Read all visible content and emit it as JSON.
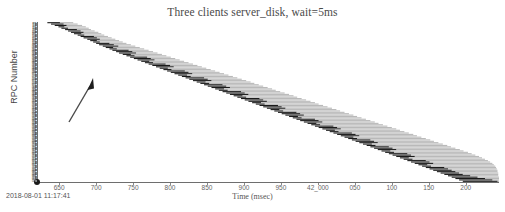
{
  "chart_data": {
    "type": "bar",
    "title": "Three clients server_disk, wait=5ms",
    "subtitle": "",
    "xlabel": "Time (msec)",
    "ylabel": "RPC Number",
    "grid": false,
    "legend_position": "none",
    "orientation": "horizontal-timeline",
    "xlim": [
      41620,
      42245
    ],
    "ylim": [
      0,
      116
    ],
    "xtick_labels": [
      "650",
      "700",
      "750",
      "800",
      "850",
      "900",
      "950",
      "42_000",
      "050",
      "100",
      "150",
      "200"
    ],
    "xtick_values": [
      41650,
      41700,
      41750,
      41800,
      41850,
      41900,
      41950,
      42000,
      42050,
      42100,
      42150,
      42200
    ],
    "ytick_labels_note": "dense unreadable microtext RPC id labels, ~116 rows",
    "ytick_count": 116,
    "series": [
      {
        "name": "rpc-dark-segment",
        "color": "#1a1a1a"
      },
      {
        "name": "rpc-light-segment",
        "color": "#b9b9b9"
      }
    ],
    "annotations": [
      {
        "name": "upward-arrow",
        "x1": 75,
        "y1": 122,
        "x2": 96,
        "y2": 80,
        "color": "#4a4a4a"
      }
    ],
    "bars": [
      {
        "row": 0,
        "dark_start": 41634,
        "dark_end": 41651,
        "light_start": 41651,
        "light_end": 41669
      },
      {
        "row": 1,
        "dark_start": 41639,
        "dark_end": 41656,
        "light_start": 41656,
        "light_end": 41675
      },
      {
        "row": 2,
        "dark_start": 41644,
        "dark_end": 41660,
        "light_start": 41660,
        "light_end": 41681
      },
      {
        "row": 3,
        "dark_start": 41649,
        "dark_end": 41657,
        "light_start": 41657,
        "light_end": 41686
      },
      {
        "row": 4,
        "dark_start": 41653,
        "dark_end": 41662,
        "light_start": 41662,
        "light_end": 41690
      },
      {
        "row": 5,
        "dark_start": 41658,
        "dark_end": 41674,
        "light_start": 41674,
        "light_end": 41693
      },
      {
        "row": 6,
        "dark_start": 41662,
        "dark_end": 41679,
        "light_start": 41679,
        "light_end": 41698
      },
      {
        "row": 7,
        "dark_start": 41666,
        "dark_end": 41683,
        "light_start": 41683,
        "light_end": 41703
      },
      {
        "row": 8,
        "dark_start": 41670,
        "dark_end": 41680,
        "light_start": 41680,
        "light_end": 41707
      },
      {
        "row": 9,
        "dark_start": 41675,
        "dark_end": 41684,
        "light_start": 41684,
        "light_end": 41711
      },
      {
        "row": 10,
        "dark_start": 41679,
        "dark_end": 41697,
        "light_start": 41697,
        "light_end": 41716
      },
      {
        "row": 11,
        "dark_start": 41683,
        "dark_end": 41701,
        "light_start": 41701,
        "light_end": 41721
      },
      {
        "row": 12,
        "dark_start": 41688,
        "dark_end": 41705,
        "light_start": 41705,
        "light_end": 41726
      },
      {
        "row": 13,
        "dark_start": 41692,
        "dark_end": 41701,
        "light_start": 41701,
        "light_end": 41731
      },
      {
        "row": 14,
        "dark_start": 41696,
        "dark_end": 41705,
        "light_start": 41705,
        "light_end": 41736
      },
      {
        "row": 15,
        "dark_start": 41700,
        "dark_end": 41718,
        "light_start": 41718,
        "light_end": 41741
      },
      {
        "row": 16,
        "dark_start": 41704,
        "dark_end": 41724,
        "light_start": 41724,
        "light_end": 41747
      },
      {
        "row": 17,
        "dark_start": 41709,
        "dark_end": 41730,
        "light_start": 41730,
        "light_end": 41753
      },
      {
        "row": 18,
        "dark_start": 41713,
        "dark_end": 41723,
        "light_start": 41723,
        "light_end": 41759
      },
      {
        "row": 19,
        "dark_start": 41718,
        "dark_end": 41728,
        "light_start": 41728,
        "light_end": 41765
      },
      {
        "row": 20,
        "dark_start": 41722,
        "dark_end": 41744,
        "light_start": 41744,
        "light_end": 41771
      },
      {
        "row": 21,
        "dark_start": 41727,
        "dark_end": 41749,
        "light_start": 41749,
        "light_end": 41777
      },
      {
        "row": 22,
        "dark_start": 41731,
        "dark_end": 41754,
        "light_start": 41754,
        "light_end": 41783
      },
      {
        "row": 23,
        "dark_start": 41736,
        "dark_end": 41747,
        "light_start": 41747,
        "light_end": 41789
      },
      {
        "row": 24,
        "dark_start": 41741,
        "dark_end": 41752,
        "light_start": 41752,
        "light_end": 41795
      },
      {
        "row": 25,
        "dark_start": 41746,
        "dark_end": 41769,
        "light_start": 41769,
        "light_end": 41801
      },
      {
        "row": 26,
        "dark_start": 41751,
        "dark_end": 41774,
        "light_start": 41774,
        "light_end": 41807
      },
      {
        "row": 27,
        "dark_start": 41756,
        "dark_end": 41779,
        "light_start": 41779,
        "light_end": 41813
      },
      {
        "row": 28,
        "dark_start": 41761,
        "dark_end": 41772,
        "light_start": 41772,
        "light_end": 41819
      },
      {
        "row": 29,
        "dark_start": 41766,
        "dark_end": 41777,
        "light_start": 41777,
        "light_end": 41825
      },
      {
        "row": 30,
        "dark_start": 41771,
        "dark_end": 41794,
        "light_start": 41794,
        "light_end": 41831
      },
      {
        "row": 31,
        "dark_start": 41776,
        "dark_end": 41800,
        "light_start": 41800,
        "light_end": 41837
      },
      {
        "row": 32,
        "dark_start": 41781,
        "dark_end": 41805,
        "light_start": 41805,
        "light_end": 41843
      },
      {
        "row": 33,
        "dark_start": 41786,
        "dark_end": 41797,
        "light_start": 41797,
        "light_end": 41849
      },
      {
        "row": 34,
        "dark_start": 41791,
        "dark_end": 41802,
        "light_start": 41802,
        "light_end": 41855
      },
      {
        "row": 35,
        "dark_start": 41796,
        "dark_end": 41820,
        "light_start": 41820,
        "light_end": 41861
      },
      {
        "row": 36,
        "dark_start": 41801,
        "dark_end": 41825,
        "light_start": 41825,
        "light_end": 41867
      },
      {
        "row": 37,
        "dark_start": 41806,
        "dark_end": 41830,
        "light_start": 41830,
        "light_end": 41873
      },
      {
        "row": 38,
        "dark_start": 41811,
        "dark_end": 41823,
        "light_start": 41823,
        "light_end": 41879
      },
      {
        "row": 39,
        "dark_start": 41816,
        "dark_end": 41828,
        "light_start": 41828,
        "light_end": 41885
      },
      {
        "row": 40,
        "dark_start": 41821,
        "dark_end": 41846,
        "light_start": 41846,
        "light_end": 41891
      },
      {
        "row": 41,
        "dark_start": 41826,
        "dark_end": 41851,
        "light_start": 41851,
        "light_end": 41897
      },
      {
        "row": 42,
        "dark_start": 41831,
        "dark_end": 41856,
        "light_start": 41856,
        "light_end": 41903
      },
      {
        "row": 43,
        "dark_start": 41836,
        "dark_end": 41848,
        "light_start": 41848,
        "light_end": 41909
      },
      {
        "row": 44,
        "dark_start": 41841,
        "dark_end": 41853,
        "light_start": 41853,
        "light_end": 41914
      },
      {
        "row": 45,
        "dark_start": 41846,
        "dark_end": 41871,
        "light_start": 41871,
        "light_end": 41920
      },
      {
        "row": 46,
        "dark_start": 41851,
        "dark_end": 41876,
        "light_start": 41876,
        "light_end": 41926
      },
      {
        "row": 47,
        "dark_start": 41856,
        "dark_end": 41881,
        "light_start": 41881,
        "light_end": 41932
      },
      {
        "row": 48,
        "dark_start": 41861,
        "dark_end": 41873,
        "light_start": 41873,
        "light_end": 41938
      },
      {
        "row": 49,
        "dark_start": 41866,
        "dark_end": 41878,
        "light_start": 41878,
        "light_end": 41943
      },
      {
        "row": 50,
        "dark_start": 41871,
        "dark_end": 41896,
        "light_start": 41896,
        "light_end": 41949
      },
      {
        "row": 51,
        "dark_start": 41876,
        "dark_end": 41901,
        "light_start": 41901,
        "light_end": 41955
      },
      {
        "row": 52,
        "dark_start": 41881,
        "dark_end": 41906,
        "light_start": 41906,
        "light_end": 41961
      },
      {
        "row": 53,
        "dark_start": 41886,
        "dark_end": 41898,
        "light_start": 41898,
        "light_end": 41967
      },
      {
        "row": 54,
        "dark_start": 41891,
        "dark_end": 41903,
        "light_start": 41903,
        "light_end": 41972
      },
      {
        "row": 55,
        "dark_start": 41896,
        "dark_end": 41921,
        "light_start": 41921,
        "light_end": 41978
      },
      {
        "row": 56,
        "dark_start": 41901,
        "dark_end": 41926,
        "light_start": 41926,
        "light_end": 41984
      },
      {
        "row": 57,
        "dark_start": 41906,
        "dark_end": 41931,
        "light_start": 41931,
        "light_end": 41990
      },
      {
        "row": 58,
        "dark_start": 41911,
        "dark_end": 41923,
        "light_start": 41923,
        "light_end": 41996
      },
      {
        "row": 59,
        "dark_start": 41916,
        "dark_end": 41928,
        "light_start": 41928,
        "light_end": 42001
      },
      {
        "row": 60,
        "dark_start": 41921,
        "dark_end": 41946,
        "light_start": 41946,
        "light_end": 42007
      },
      {
        "row": 61,
        "dark_start": 41926,
        "dark_end": 41951,
        "light_start": 41951,
        "light_end": 42013
      },
      {
        "row": 62,
        "dark_start": 41931,
        "dark_end": 41956,
        "light_start": 41956,
        "light_end": 42019
      },
      {
        "row": 63,
        "dark_start": 41936,
        "dark_end": 41948,
        "light_start": 41948,
        "light_end": 42025
      },
      {
        "row": 64,
        "dark_start": 41941,
        "dark_end": 41953,
        "light_start": 41953,
        "light_end": 42030
      },
      {
        "row": 65,
        "dark_start": 41946,
        "dark_end": 41971,
        "light_start": 41971,
        "light_end": 42036
      },
      {
        "row": 66,
        "dark_start": 41951,
        "dark_end": 41976,
        "light_start": 41976,
        "light_end": 42042
      },
      {
        "row": 67,
        "dark_start": 41956,
        "dark_end": 41981,
        "light_start": 41981,
        "light_end": 42048
      },
      {
        "row": 68,
        "dark_start": 41961,
        "dark_end": 41973,
        "light_start": 41973,
        "light_end": 42053
      },
      {
        "row": 69,
        "dark_start": 41966,
        "dark_end": 41978,
        "light_start": 41978,
        "light_end": 42059
      },
      {
        "row": 70,
        "dark_start": 41971,
        "dark_end": 41996,
        "light_start": 41996,
        "light_end": 42065
      },
      {
        "row": 71,
        "dark_start": 41976,
        "dark_end": 42001,
        "light_start": 42001,
        "light_end": 42071
      },
      {
        "row": 72,
        "dark_start": 41981,
        "dark_end": 42006,
        "light_start": 42006,
        "light_end": 42077
      },
      {
        "row": 73,
        "dark_start": 41986,
        "dark_end": 41998,
        "light_start": 41998,
        "light_end": 42082
      },
      {
        "row": 74,
        "dark_start": 41991,
        "dark_end": 42003,
        "light_start": 42003,
        "light_end": 42088
      },
      {
        "row": 75,
        "dark_start": 41996,
        "dark_end": 42021,
        "light_start": 42021,
        "light_end": 42094
      },
      {
        "row": 76,
        "dark_start": 42001,
        "dark_end": 42026,
        "light_start": 42026,
        "light_end": 42100
      },
      {
        "row": 77,
        "dark_start": 42006,
        "dark_end": 42031,
        "light_start": 42031,
        "light_end": 42106
      },
      {
        "row": 78,
        "dark_start": 42011,
        "dark_end": 42023,
        "light_start": 42023,
        "light_end": 42111
      },
      {
        "row": 79,
        "dark_start": 42016,
        "dark_end": 42028,
        "light_start": 42028,
        "light_end": 42117
      },
      {
        "row": 80,
        "dark_start": 42021,
        "dark_end": 42046,
        "light_start": 42046,
        "light_end": 42123
      },
      {
        "row": 81,
        "dark_start": 42026,
        "dark_end": 42051,
        "light_start": 42051,
        "light_end": 42129
      },
      {
        "row": 82,
        "dark_start": 42031,
        "dark_end": 42056,
        "light_start": 42056,
        "light_end": 42134
      },
      {
        "row": 83,
        "dark_start": 42036,
        "dark_end": 42048,
        "light_start": 42048,
        "light_end": 42140
      },
      {
        "row": 84,
        "dark_start": 42041,
        "dark_end": 42053,
        "light_start": 42053,
        "light_end": 42146
      },
      {
        "row": 85,
        "dark_start": 42046,
        "dark_end": 42071,
        "light_start": 42071,
        "light_end": 42152
      },
      {
        "row": 86,
        "dark_start": 42051,
        "dark_end": 42076,
        "light_start": 42076,
        "light_end": 42157
      },
      {
        "row": 87,
        "dark_start": 42056,
        "dark_end": 42081,
        "light_start": 42081,
        "light_end": 42163
      },
      {
        "row": 88,
        "dark_start": 42061,
        "dark_end": 42073,
        "light_start": 42073,
        "light_end": 42169
      },
      {
        "row": 89,
        "dark_start": 42066,
        "dark_end": 42078,
        "light_start": 42078,
        "light_end": 42175
      },
      {
        "row": 90,
        "dark_start": 42071,
        "dark_end": 42096,
        "light_start": 42096,
        "light_end": 42180
      },
      {
        "row": 91,
        "dark_start": 42076,
        "dark_end": 42101,
        "light_start": 42101,
        "light_end": 42186
      },
      {
        "row": 92,
        "dark_start": 42081,
        "dark_end": 42106,
        "light_start": 42106,
        "light_end": 42192
      },
      {
        "row": 93,
        "dark_start": 42086,
        "dark_end": 42098,
        "light_start": 42098,
        "light_end": 42197
      },
      {
        "row": 94,
        "dark_start": 42091,
        "dark_end": 42103,
        "light_start": 42103,
        "light_end": 42203
      },
      {
        "row": 95,
        "dark_start": 42096,
        "dark_end": 42121,
        "light_start": 42121,
        "light_end": 42208
      },
      {
        "row": 96,
        "dark_start": 42101,
        "dark_end": 42126,
        "light_start": 42126,
        "light_end": 42213
      },
      {
        "row": 97,
        "dark_start": 42106,
        "dark_end": 42131,
        "light_start": 42131,
        "light_end": 42218
      },
      {
        "row": 98,
        "dark_start": 42111,
        "dark_end": 42123,
        "light_start": 42123,
        "light_end": 42222
      },
      {
        "row": 99,
        "dark_start": 42116,
        "dark_end": 42128,
        "light_start": 42128,
        "light_end": 42226
      },
      {
        "row": 100,
        "dark_start": 42121,
        "dark_end": 42146,
        "light_start": 42146,
        "light_end": 42230
      },
      {
        "row": 101,
        "dark_start": 42126,
        "dark_end": 42151,
        "light_start": 42151,
        "light_end": 42233
      },
      {
        "row": 102,
        "dark_start": 42131,
        "dark_end": 42156,
        "light_start": 42156,
        "light_end": 42236
      },
      {
        "row": 103,
        "dark_start": 42136,
        "dark_end": 42148,
        "light_start": 42148,
        "light_end": 42238
      },
      {
        "row": 104,
        "dark_start": 42141,
        "dark_end": 42153,
        "light_start": 42153,
        "light_end": 42240
      },
      {
        "row": 105,
        "dark_start": 42146,
        "dark_end": 42171,
        "light_start": 42171,
        "light_end": 42241
      },
      {
        "row": 106,
        "dark_start": 42151,
        "dark_end": 42176,
        "light_start": 42176,
        "light_end": 42242
      },
      {
        "row": 107,
        "dark_start": 42156,
        "dark_end": 42181,
        "light_start": 42181,
        "light_end": 42243
      },
      {
        "row": 108,
        "dark_start": 42161,
        "dark_end": 42186,
        "light_start": 42186,
        "light_end": 42243
      },
      {
        "row": 109,
        "dark_start": 42166,
        "dark_end": 42191,
        "light_start": 42191,
        "light_end": 42244
      },
      {
        "row": 110,
        "dark_start": 42171,
        "dark_end": 42196,
        "light_start": 42196,
        "light_end": 42244
      },
      {
        "row": 111,
        "dark_start": 42176,
        "dark_end": 42206,
        "light_start": 42206,
        "light_end": 42244
      },
      {
        "row": 112,
        "dark_start": 42181,
        "dark_end": 42216,
        "light_start": 42216,
        "light_end": 42245
      },
      {
        "row": 113,
        "dark_start": 42186,
        "dark_end": 42226,
        "light_start": 42226,
        "light_end": 42245
      },
      {
        "row": 114,
        "dark_start": 42191,
        "dark_end": 42236,
        "light_start": 42236,
        "light_end": 42245
      },
      {
        "row": 115,
        "dark_start": 42196,
        "dark_end": 42243,
        "light_start": 42243,
        "light_end": 42245
      }
    ]
  },
  "footer": {
    "timestamp": "2018-08-01 11:17:41"
  },
  "colors": {
    "dark_bar": "#1a1a1a",
    "light_bar": "#b9b9b9",
    "axis": "#6e6e6e",
    "text": "#555555",
    "title": "#4a4a4a"
  }
}
